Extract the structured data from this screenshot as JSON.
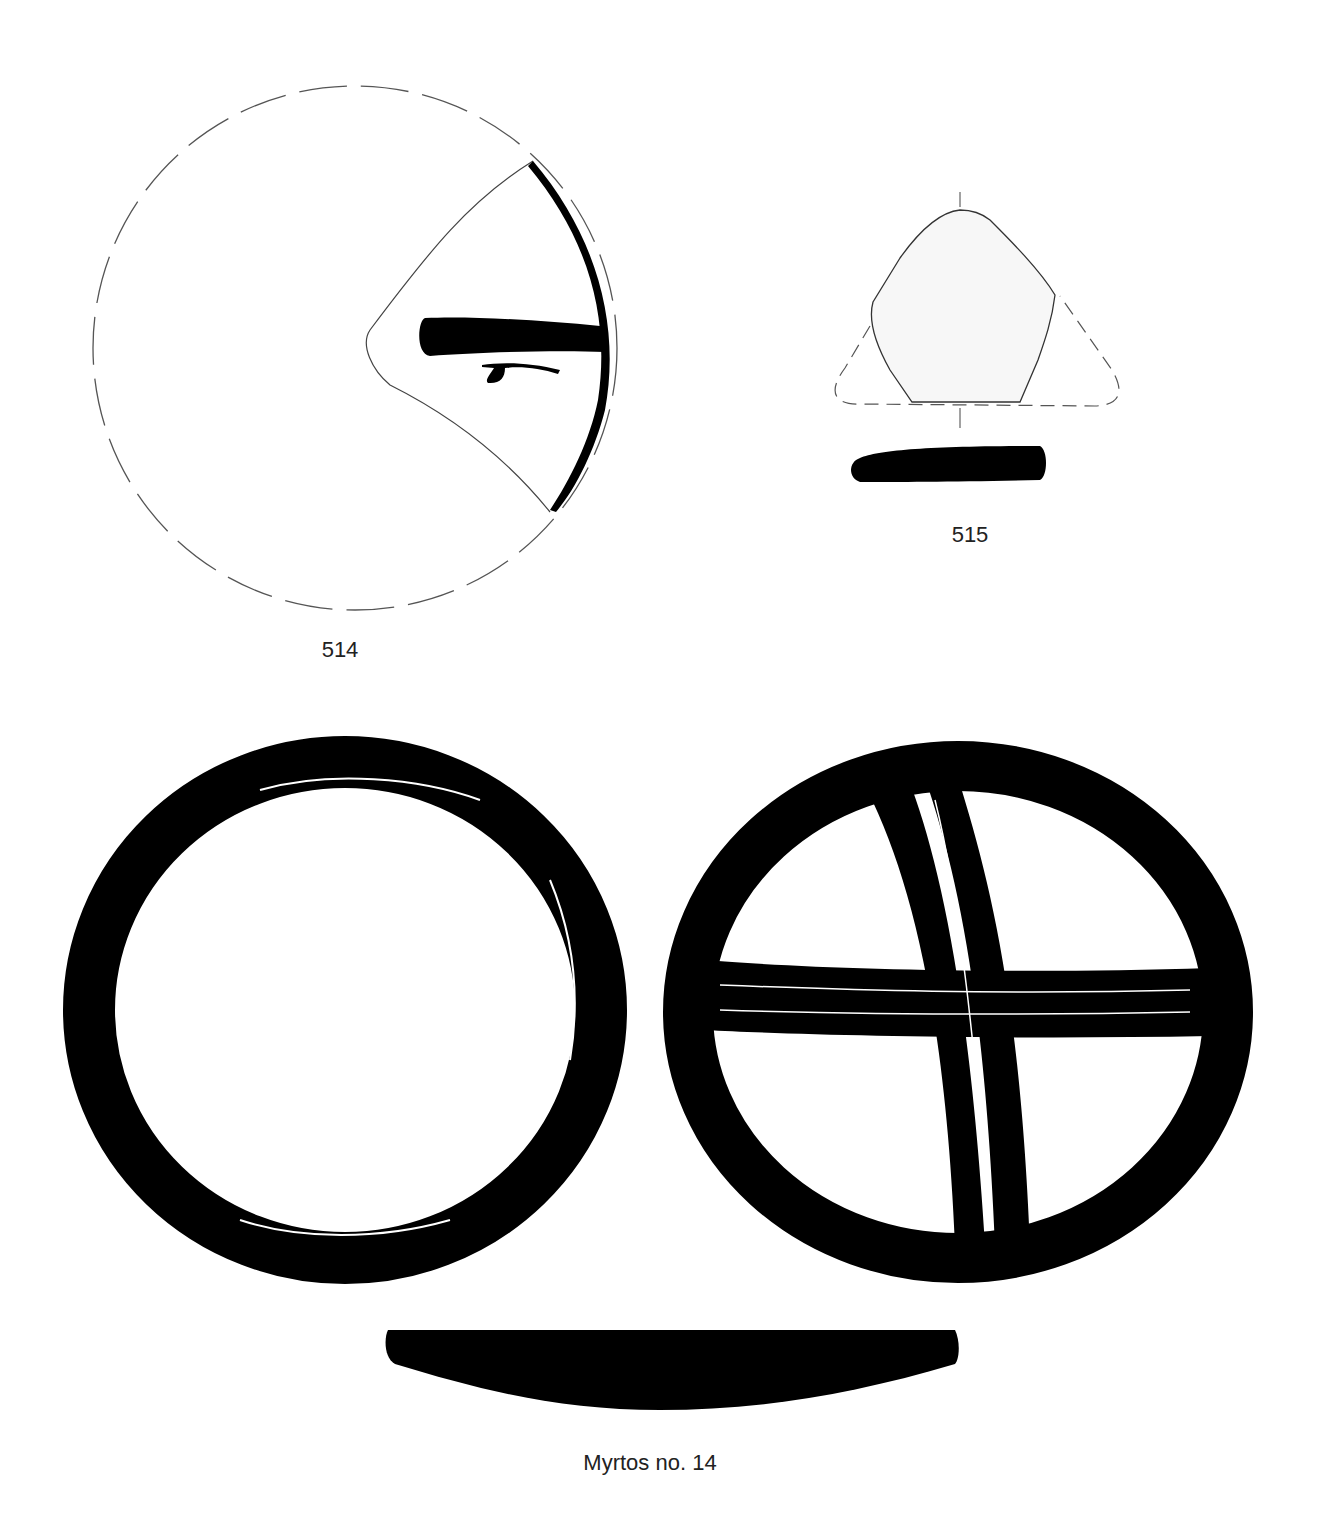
{
  "plate": {
    "background": "#ffffff",
    "ink": "#000000",
    "figures": [
      {
        "id": "514",
        "label": "514",
        "description": "Fragmentary disc, reconstructed outline dashed, painted band and mark"
      },
      {
        "id": "515",
        "label": "515",
        "description": "Triangular fragment with section profile"
      },
      {
        "id": "myrtos-14",
        "label": "Myrtos no. 14",
        "description": "Disc, plain face and cross-banded face, with section profile"
      }
    ]
  }
}
